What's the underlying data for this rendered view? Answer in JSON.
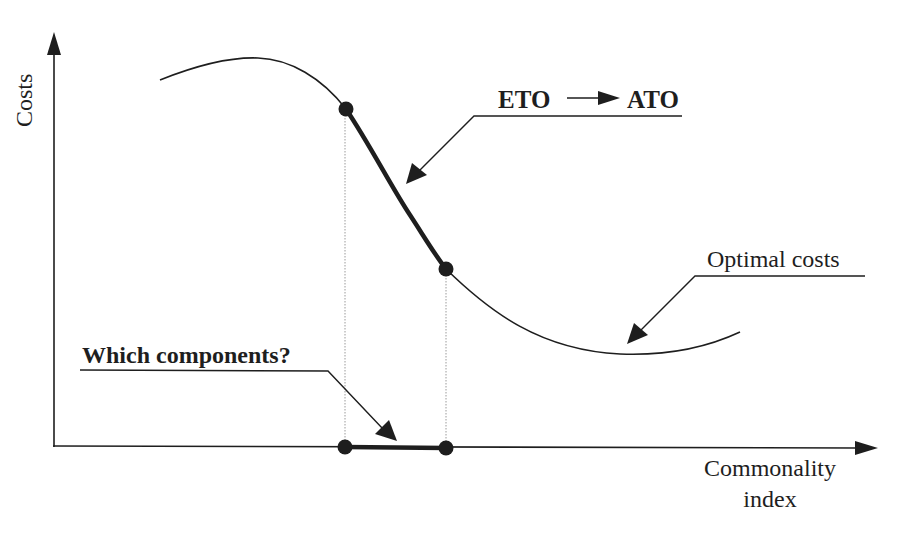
{
  "diagram": {
    "y_axis_label": "Costs",
    "x_axis_label_line1": "Commonality",
    "x_axis_label_line2": "index",
    "annotation_transition_from": "ETO",
    "annotation_transition_to": "ATO",
    "annotation_optimal": "Optimal costs",
    "annotation_components": "Which components?",
    "colors": {
      "stroke": "#1e1e1e",
      "guide": "#9a9a9a",
      "background": "#ffffff"
    }
  }
}
